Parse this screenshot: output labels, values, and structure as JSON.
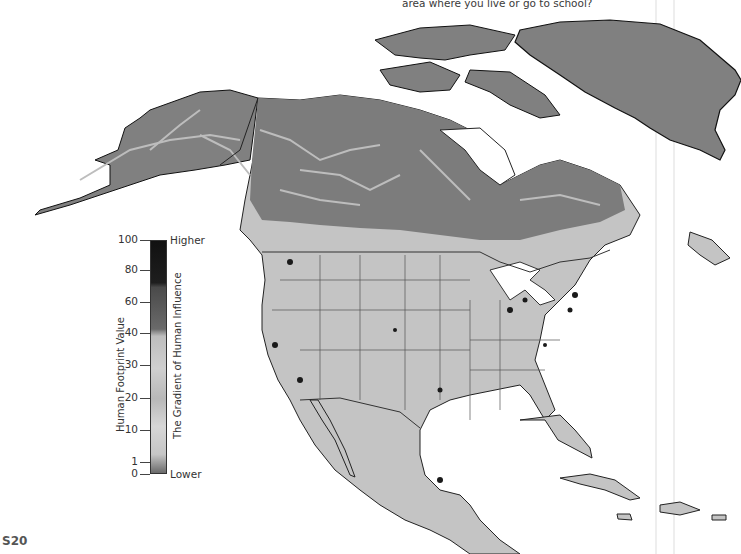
{
  "page": {
    "caption_fragment": "area where you live or go to school?",
    "page_number": "S20"
  },
  "map": {
    "title": "Human Footprint — North America",
    "region": "North America",
    "background_color": "#ffffff",
    "land_colors": {
      "low_influence": "#7a7a7a",
      "medium_influence": "#c8c8c8",
      "high_influence": "#1a1a1a",
      "border": "#222222"
    }
  },
  "legend": {
    "axis_title": "Human Footprint Value",
    "gradient_title": "The Gradient of Human Influence",
    "high_label": "Higher",
    "low_label": "Lower",
    "ticks": [
      "100",
      "80",
      "60",
      "40",
      "30",
      "20",
      "10",
      "1",
      "0"
    ]
  }
}
